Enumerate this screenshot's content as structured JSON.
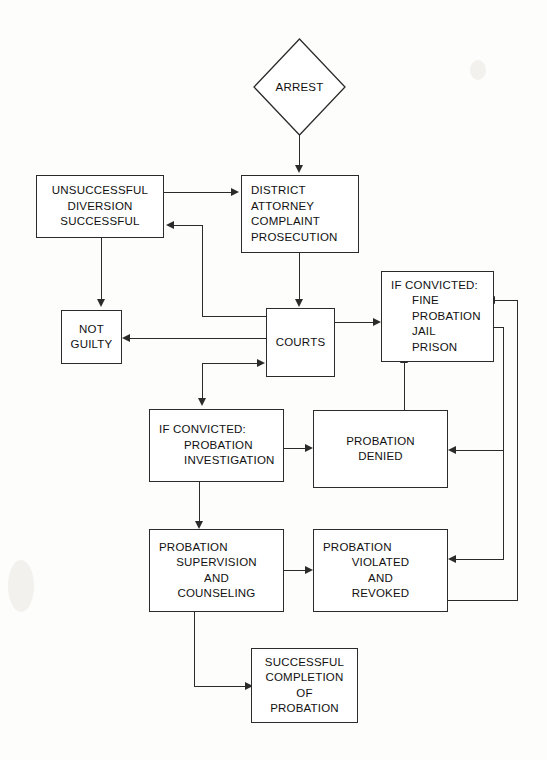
{
  "diagram": {
    "stroke_color": "#2b2b2b",
    "background_color": "#fdfdfb",
    "text_color": "#111111",
    "nodes": {
      "arrest": {
        "shape": "diamond",
        "label": "ARREST"
      },
      "diversion": {
        "shape": "rect",
        "lines": [
          "UNSUCCESSFUL",
          "DIVERSION",
          "SUCCESSFUL"
        ]
      },
      "district_attorney": {
        "shape": "rect",
        "lines": [
          "DISTRICT",
          "ATTORNEY",
          "COMPLAINT",
          "PROSECUTION"
        ]
      },
      "not_guilty": {
        "shape": "rect",
        "lines": [
          "NOT",
          "GUILTY"
        ]
      },
      "courts": {
        "shape": "rect",
        "lines": [
          "COURTS"
        ]
      },
      "if_convicted_sentence": {
        "shape": "rect",
        "lines": [
          "IF CONVICTED:",
          "FINE",
          "PROBATION",
          "JAIL",
          "PRISON"
        ]
      },
      "if_convicted_probation": {
        "shape": "rect",
        "lines": [
          "IF CONVICTED:",
          "PROBATION",
          "INVESTIGATION"
        ]
      },
      "probation_denied": {
        "shape": "rect",
        "lines": [
          "PROBATION",
          "DENIED"
        ]
      },
      "probation_supervision": {
        "shape": "rect",
        "lines": [
          "PROBATION",
          "SUPERVISION",
          "AND",
          "COUNSELING"
        ]
      },
      "probation_violated": {
        "shape": "rect",
        "lines": [
          "PROBATION",
          "VIOLATED",
          "AND",
          "REVOKED"
        ]
      },
      "successful_completion": {
        "shape": "rect",
        "lines": [
          "SUCCESSFUL",
          "COMPLETION",
          "OF",
          "PROBATION"
        ]
      }
    },
    "edges": [
      {
        "from": "arrest",
        "to": "district_attorney",
        "direction": "down"
      },
      {
        "from": "diversion",
        "to": "district_attorney",
        "direction": "right"
      },
      {
        "from": "district_attorney",
        "to": "diversion",
        "direction": "left"
      },
      {
        "from": "diversion",
        "to": "not_guilty",
        "direction": "down"
      },
      {
        "from": "district_attorney",
        "to": "courts",
        "direction": "down"
      },
      {
        "from": "courts",
        "to": "not_guilty",
        "direction": "left"
      },
      {
        "from": "courts",
        "to": "if_convicted_sentence",
        "direction": "right"
      },
      {
        "from": "courts",
        "to": "if_convicted_probation",
        "direction": "down-left"
      },
      {
        "from": "if_convicted_probation",
        "to": "probation_denied",
        "direction": "right"
      },
      {
        "from": "probation_denied",
        "to": "if_convicted_sentence",
        "direction": "up"
      },
      {
        "from": "if_convicted_probation",
        "to": "probation_supervision",
        "direction": "down"
      },
      {
        "from": "probation_supervision",
        "to": "probation_violated",
        "direction": "right"
      },
      {
        "from": "probation_violated",
        "to": "if_convicted_sentence",
        "direction": "right-loop"
      },
      {
        "from": "probation_violated",
        "to": "probation_denied",
        "direction": "right-loop"
      },
      {
        "from": "probation_supervision",
        "to": "successful_completion",
        "direction": "down-right"
      }
    ]
  }
}
